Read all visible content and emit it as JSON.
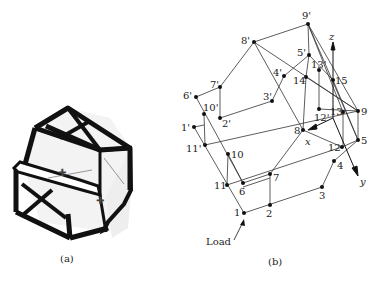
{
  "figure_a": {
    "caption": "(a)"
  },
  "figure_b": {
    "caption": "(b)",
    "load_label": "Load",
    "axes": {
      "x": "x",
      "y": "y",
      "z": "z"
    },
    "nodes": [
      {
        "id": "9'",
        "x": 308,
        "y": 24,
        "lx": 302,
        "ly": 19
      },
      {
        "id": "8'",
        "x": 254,
        "y": 42,
        "lx": 241,
        "ly": 44
      },
      {
        "id": "5'",
        "x": 309,
        "y": 55,
        "lx": 297,
        "ly": 56
      },
      {
        "id": "13'",
        "x": 319,
        "y": 70,
        "lx": 311,
        "ly": 68
      },
      {
        "id": "4'",
        "x": 284,
        "y": 76,
        "lx": 273,
        "ly": 76
      },
      {
        "id": "14",
        "x": 306,
        "y": 77,
        "lx": 293,
        "ly": 84
      },
      {
        "id": "15",
        "x": 333,
        "y": 80,
        "lx": 335,
        "ly": 84
      },
      {
        "id": "7'",
        "x": 220,
        "y": 87,
        "lx": 210,
        "ly": 88
      },
      {
        "id": "6'",
        "x": 196,
        "y": 97,
        "lx": 183,
        "ly": 99
      },
      {
        "id": "3'",
        "x": 272,
        "y": 101,
        "lx": 263,
        "ly": 100
      },
      {
        "id": "10'",
        "x": 204,
        "y": 114,
        "lx": 203,
        "ly": 111
      },
      {
        "id": "12'",
        "x": 319,
        "y": 109,
        "lx": 314,
        "ly": 121
      },
      {
        "id": "13",
        "x": 343,
        "y": 112,
        "lx": 330,
        "ly": 115
      },
      {
        "id": "9",
        "x": 358,
        "y": 111,
        "lx": 361,
        "ly": 115
      },
      {
        "id": "2'",
        "x": 220,
        "y": 118,
        "lx": 222,
        "ly": 127
      },
      {
        "id": "1'",
        "x": 194,
        "y": 127,
        "lx": 181,
        "ly": 131
      },
      {
        "id": "8",
        "x": 303,
        "y": 130,
        "lx": 294,
        "ly": 134
      },
      {
        "id": "11'",
        "x": 205,
        "y": 145,
        "lx": 186,
        "ly": 152
      },
      {
        "id": "12",
        "x": 342,
        "y": 147,
        "lx": 328,
        "ly": 151
      },
      {
        "id": "5",
        "x": 358,
        "y": 140,
        "lx": 361,
        "ly": 144
      },
      {
        "id": "10",
        "x": 228,
        "y": 154,
        "lx": 231,
        "ly": 158
      },
      {
        "id": "4",
        "x": 334,
        "y": 161,
        "lx": 337,
        "ly": 169
      },
      {
        "id": "7",
        "x": 270,
        "y": 174,
        "lx": 273,
        "ly": 181
      },
      {
        "id": "11",
        "x": 227,
        "y": 185,
        "lx": 214,
        "ly": 189
      },
      {
        "id": "6",
        "x": 243,
        "y": 183,
        "lx": 239,
        "ly": 195
      },
      {
        "id": "3",
        "x": 322,
        "y": 187,
        "lx": 319,
        "ly": 199
      },
      {
        "id": "2",
        "x": 270,
        "y": 205,
        "lx": 266,
        "ly": 217
      },
      {
        "id": "1",
        "x": 244,
        "y": 213,
        "lx": 234,
        "ly": 216
      }
    ]
  }
}
